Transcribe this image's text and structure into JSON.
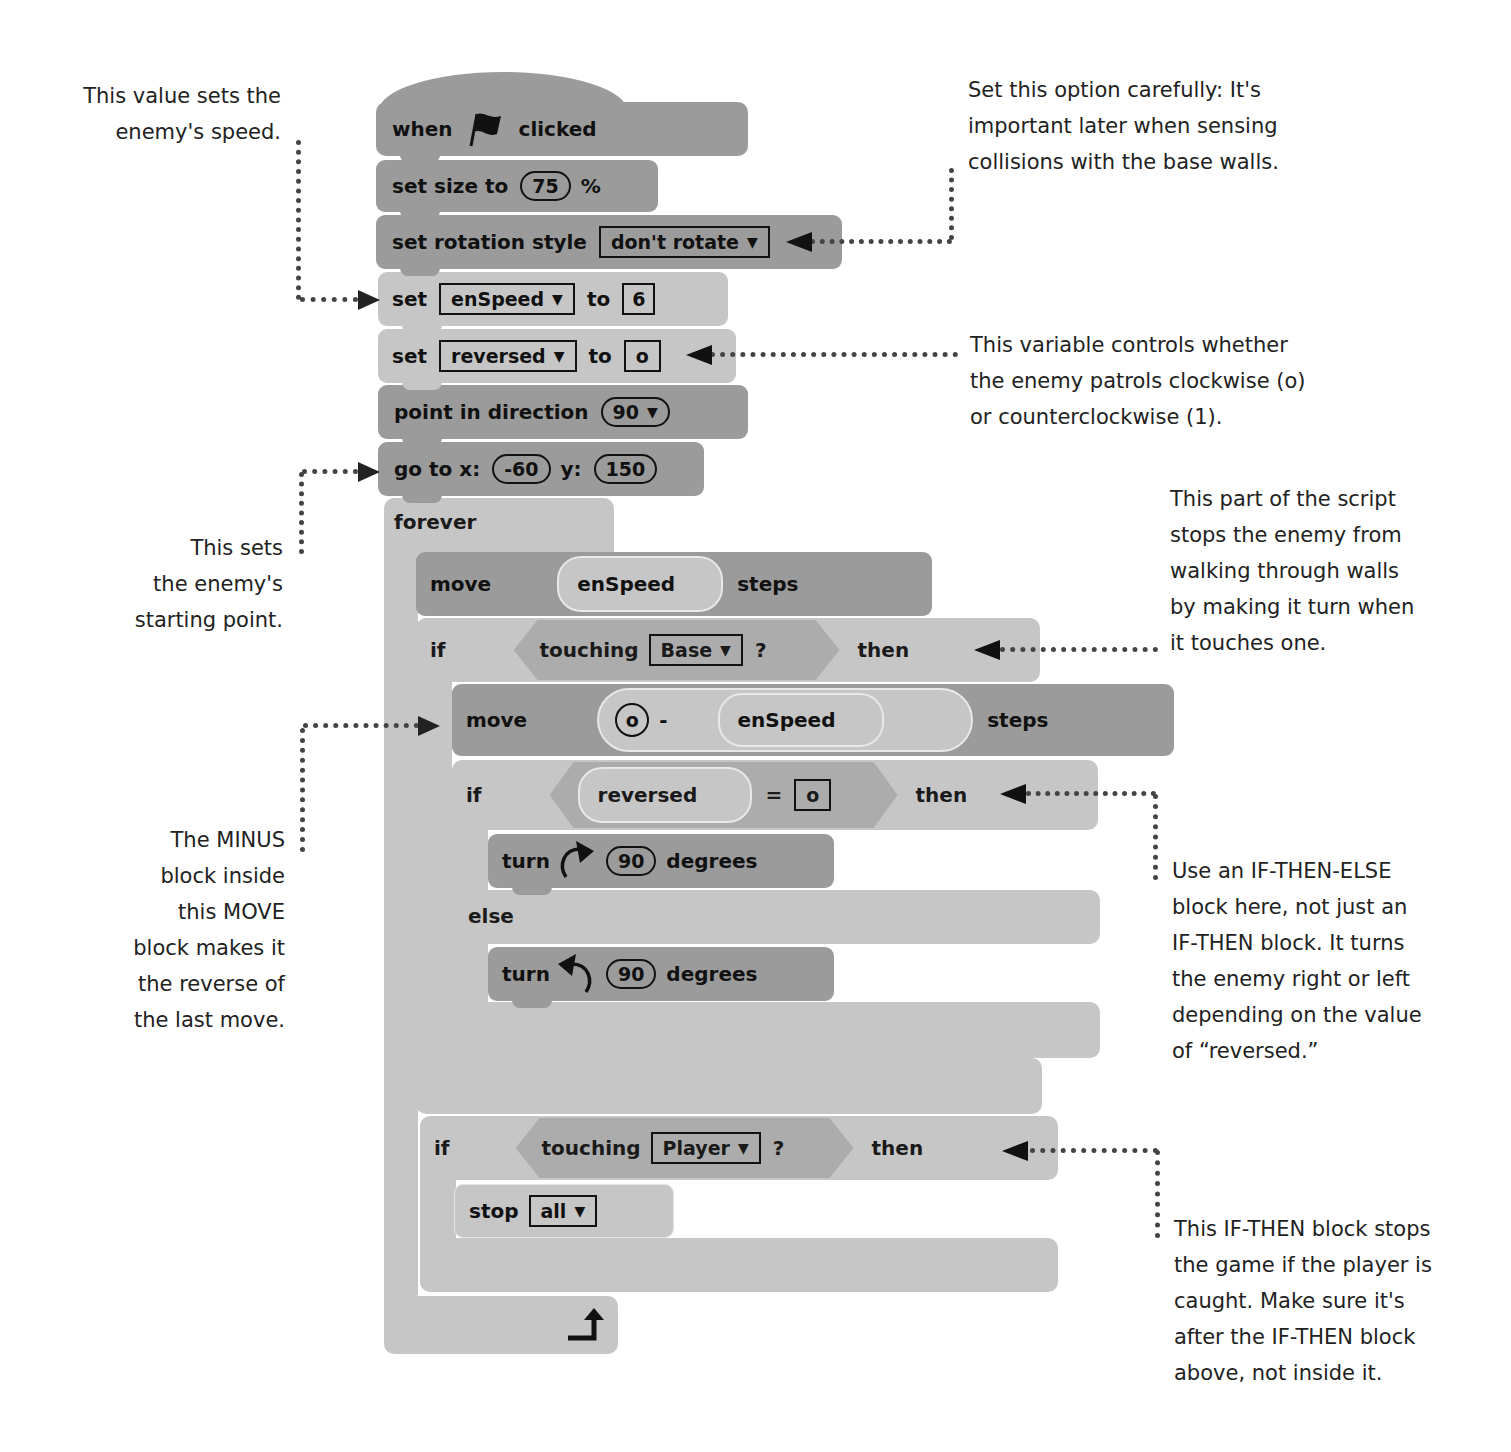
{
  "colors": {
    "dark_block": "#9b9b9b",
    "light_block": "#c6c6c6",
    "predicate": "#acacac",
    "text": "#111111",
    "annotation_line": "#444444"
  },
  "script": {
    "hat": {
      "when": "when",
      "icon": "green-flag-icon",
      "clicked": "clicked"
    },
    "set_size": {
      "label": "set size to",
      "value": "75",
      "unit": "%"
    },
    "rotation": {
      "label": "set rotation style",
      "value": "don't rotate"
    },
    "set_speed": {
      "set": "set",
      "var": "enSpeed",
      "to": "to",
      "value": "6"
    },
    "set_reversed": {
      "set": "set",
      "var": "reversed",
      "to": "to",
      "value": "o"
    },
    "point": {
      "label": "point in direction",
      "value": "90"
    },
    "goto": {
      "label": "go to x:",
      "x": "-60",
      "ylabel": "y:",
      "y": "150"
    },
    "forever": {
      "label": "forever"
    },
    "move1": {
      "label": "move",
      "reporter": "enSpeed",
      "steps": "steps"
    },
    "if_base": {
      "if": "if",
      "touching": "touching",
      "target": "Base",
      "q": "?",
      "then": "then"
    },
    "move2": {
      "label": "move",
      "zero": "o",
      "minus": "-",
      "reporter": "enSpeed",
      "steps": "steps"
    },
    "if_rev": {
      "if": "if",
      "reporter": "reversed",
      "eq": "=",
      "value": "o",
      "then": "then"
    },
    "turn_right": {
      "label": "turn",
      "value": "90",
      "degrees": "degrees"
    },
    "else": {
      "label": "else"
    },
    "turn_left": {
      "label": "turn",
      "value": "90",
      "degrees": "degrees"
    },
    "if_player": {
      "if": "if",
      "touching": "touching",
      "target": "Player",
      "q": "?",
      "then": "then"
    },
    "stop": {
      "label": "stop",
      "value": "all"
    }
  },
  "annotations": {
    "speed": [
      "This value sets the",
      "enemy's speed."
    ],
    "rotation": [
      "Set this option carefully: It's",
      "important later when sensing",
      "collisions with the base walls."
    ],
    "reversed": [
      "This variable controls whether",
      "the enemy patrols clockwise (o)",
      "or counterclockwise (1)."
    ],
    "start": [
      "This sets",
      "the enemy's",
      "starting point."
    ],
    "walls": [
      "This part of the script",
      "stops the enemy from",
      "walking through walls",
      "by making it turn when",
      "it touches one."
    ],
    "minus": [
      "The MINUS",
      "block inside",
      "this MOVE",
      "block makes it",
      "the reverse of",
      "the last move."
    ],
    "ifelse": [
      "Use an IF-THEN-ELSE",
      "block here, not just an",
      "IF-THEN block. It turns",
      "the enemy right or left",
      "depending on the value",
      "of “reversed.”"
    ],
    "player": [
      "This IF-THEN block stops",
      "the game if the player is",
      "caught. Make sure it's",
      "after the IF-THEN block",
      "above, not inside it."
    ]
  }
}
